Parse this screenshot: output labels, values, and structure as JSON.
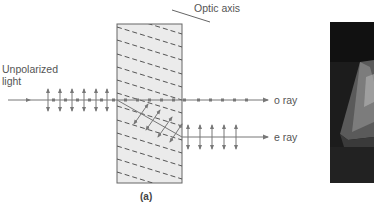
{
  "figure": {
    "panel_label": "(a)",
    "labels": {
      "incident": "Unpolarized\nlight",
      "incident_line1": "Unpolarized",
      "incident_line2": "light",
      "optic_axis": "Optic axis",
      "o_ray": "o ray",
      "e_ray": "e ray"
    },
    "colors": {
      "line": "#777777",
      "crystal_fill": "#ebebeb",
      "crystal_border": "#666666",
      "text": "#555555",
      "photo_bg": "#1a1a1a"
    },
    "photo": {
      "description": "dark photograph of calcite crystal (partially cropped)"
    }
  }
}
